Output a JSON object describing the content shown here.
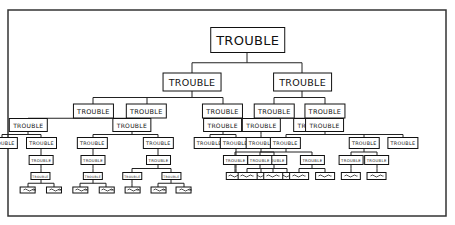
{
  "diagram": {
    "type": "tree",
    "node_label": "TROUBLE",
    "colors": {
      "ink": "#111111",
      "background": "#ffffff",
      "frame": "#333333"
    },
    "root": {
      "label": "TROUBLE",
      "children": [
        {
          "label": "TROUBLE",
          "children": [
            {
              "label": "TROUBLE",
              "children": [
                {
                  "label": "TROUBLE",
                  "children": [
                    {
                      "label": "TROUBLE",
                      "children": []
                    },
                    {
                      "label": "TROUBLE",
                      "children": [
                        {
                          "label": "TROUBLE",
                          "children": [
                            {
                              "label": "TROUBLE",
                              "children": [
                                {
                                  "label": "",
                                  "children": []
                                },
                                {
                                  "label": "",
                                  "children": []
                                }
                              ]
                            }
                          ]
                        }
                      ]
                    }
                  ]
                },
                {
                  "label": "TROUBLE",
                  "children": [
                    {
                      "label": "TROUBLE",
                      "children": [
                        {
                          "label": "TROUBLE",
                          "children": [
                            {
                              "label": "TROUBLE",
                              "children": [
                                {
                                  "label": "",
                                  "children": []
                                },
                                {
                                  "label": "",
                                  "children": []
                                }
                              ]
                            }
                          ]
                        }
                      ]
                    },
                    {
                      "label": "TROUBLE",
                      "children": [
                        {
                          "label": "TROUBLE",
                          "children": [
                            {
                              "label": "TROUBLE",
                              "children": [
                                {
                                  "label": "",
                                  "children": []
                                }
                              ]
                            },
                            {
                              "label": "TROUBLE",
                              "children": [
                                {
                                  "label": "",
                                  "children": []
                                },
                                {
                                  "label": "",
                                  "children": []
                                }
                              ]
                            }
                          ]
                        }
                      ]
                    }
                  ]
                }
              ]
            },
            {
              "label": "TROUBLE",
              "children": []
            },
            {
              "label": "TROUBLE",
              "children": [
                {
                  "label": "TROUBLE",
                  "children": [
                    {
                      "label": "TROUBLE",
                      "children": []
                    },
                    {
                      "label": "TROUBLE",
                      "children": [
                        {
                          "label": "TROUBLE",
                          "children": [
                            {
                              "label": "",
                              "children": []
                            }
                          ]
                        }
                      ]
                    }
                  ]
                }
              ]
            }
          ]
        },
        {
          "label": "TROUBLE",
          "children": [
            {
              "label": "TROUBLE",
              "children": [
                {
                  "label": "TROUBLE",
                  "children": [
                    {
                      "label": "TROUBLE",
                      "children": [
                        {
                          "label": "TROUBLE",
                          "children": [
                            {
                              "label": "",
                              "children": []
                            }
                          ]
                        },
                        {
                          "label": "TROUBLE",
                          "children": [
                            {
                              "label": "",
                              "children": []
                            },
                            {
                              "label": "",
                              "children": []
                            }
                          ]
                        }
                      ]
                    }
                  ]
                },
                {
                  "label": "TROUBLE",
                  "children": []
                }
              ]
            },
            {
              "label": "TROUBLE",
              "children": [
                {
                  "label": "TROUBLE",
                  "children": [
                    {
                      "label": "TROUBLE",
                      "children": [
                        {
                          "label": "TROUBLE",
                          "children": [
                            {
                              "label": "",
                              "children": []
                            },
                            {
                              "label": "",
                              "children": []
                            }
                          ]
                        },
                        {
                          "label": "TROUBLE",
                          "children": [
                            {
                              "label": "",
                              "children": []
                            },
                            {
                              "label": "",
                              "children": []
                            }
                          ]
                        }
                      ]
                    },
                    {
                      "label": "TROUBLE",
                      "children": [
                        {
                          "label": "TROUBLE",
                          "children": [
                            {
                              "label": "",
                              "children": []
                            }
                          ]
                        },
                        {
                          "label": "TROUBLE",
                          "children": [
                            {
                              "label": "",
                              "children": []
                            }
                          ]
                        }
                      ]
                    },
                    {
                      "label": "TROUBLE",
                      "children": []
                    }
                  ]
                }
              ]
            }
          ]
        }
      ]
    }
  }
}
